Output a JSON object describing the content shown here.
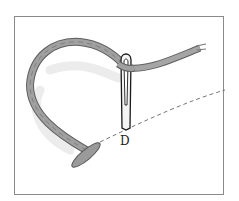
{
  "diagram": {
    "point_label": "D",
    "colors": {
      "frame": "#8a8a8a",
      "thread": "#9a9a9a",
      "thread_dark": "#5f5f5f",
      "shadow": "#e6e6e6",
      "needle": "#1a1a1a",
      "stitch_line": "#666666"
    }
  }
}
